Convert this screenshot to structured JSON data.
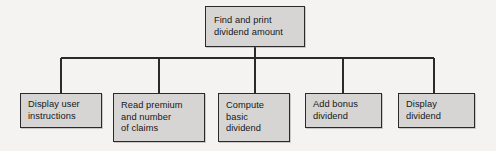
{
  "diagram": {
    "type": "structure-chart",
    "canvas": {
      "width": 496,
      "height": 151,
      "background": "#f4f3f1"
    },
    "style": {
      "box_fill": "#d6d5d3",
      "box_border": "#2a2a2a",
      "connector_color": "#2a2a2a",
      "text_color": "#17181a"
    },
    "root": {
      "id": "root",
      "lines": [
        "Find and print",
        "dividend amount"
      ],
      "text": "Find and print dividend amount"
    },
    "children": [
      {
        "id": "child-0",
        "lines": [
          "Display user",
          "instructions"
        ],
        "text": "Display user instructions"
      },
      {
        "id": "child-1",
        "lines": [
          "Read premium",
          "and number",
          "of claims"
        ],
        "text": "Read premium and number of claims"
      },
      {
        "id": "child-2",
        "lines": [
          "Compute",
          "basic",
          "dividend"
        ],
        "text": "Compute basic dividend"
      },
      {
        "id": "child-3",
        "lines": [
          "Add bonus",
          "dividend"
        ],
        "text": "Add bonus dividend"
      },
      {
        "id": "child-4",
        "lines": [
          "Display",
          "dividend"
        ],
        "text": "Display dividend"
      }
    ],
    "connectors": {
      "root_stem": {
        "x": 255,
        "y1": 47,
        "y2": 58
      },
      "bus": {
        "y": 58,
        "x1": 61,
        "x2": 434
      },
      "drops": [
        {
          "x": 61,
          "y1": 58,
          "y2": 93
        },
        {
          "x": 159,
          "y1": 58,
          "y2": 93
        },
        {
          "x": 255,
          "y1": 58,
          "y2": 93
        },
        {
          "x": 343,
          "y1": 58,
          "y2": 93
        },
        {
          "x": 434,
          "y1": 58,
          "y2": 93
        }
      ]
    }
  }
}
